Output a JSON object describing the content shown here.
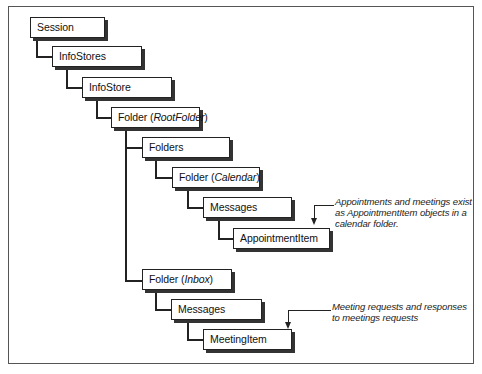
{
  "diagram": {
    "nodes": {
      "session": {
        "label": "Session"
      },
      "infostores": {
        "label": "InfoStores"
      },
      "infostore": {
        "label": "InfoStore"
      },
      "rootfolder": {
        "prefix": "Folder (",
        "italic": "RootFolder",
        "suffix": ")"
      },
      "folders": {
        "label": "Folders"
      },
      "calendar": {
        "prefix": "Folder (",
        "italic": "Calendar",
        "suffix": ")"
      },
      "messages_calendar": {
        "label": "Messages"
      },
      "appointmentitem": {
        "label": "AppointmentItem"
      },
      "inbox": {
        "prefix": "Folder (",
        "italic": "Inbox",
        "suffix": ")"
      },
      "messages_inbox": {
        "label": "Messages"
      },
      "meetingitem": {
        "label": "MeetingItem"
      }
    },
    "notes": {
      "appointment": [
        "Appointments and meetings exist",
        "as AppointmentItem objects in a",
        "calendar folder."
      ],
      "meeting": [
        "Meeting requests and responses",
        "to meetings requests"
      ]
    },
    "edges": [
      [
        "Session",
        "InfoStores"
      ],
      [
        "InfoStores",
        "InfoStore"
      ],
      [
        "InfoStore",
        "Folder (RootFolder)"
      ],
      [
        "Folder (RootFolder)",
        "Folders"
      ],
      [
        "Folder (RootFolder)",
        "Folder (Inbox)"
      ],
      [
        "Folders",
        "Folder (Calendar)"
      ],
      [
        "Folder (Calendar)",
        "Messages"
      ],
      [
        "Messages",
        "AppointmentItem"
      ],
      [
        "Folder (Inbox)",
        "Messages"
      ],
      [
        "Messages",
        "MeetingItem"
      ]
    ]
  }
}
